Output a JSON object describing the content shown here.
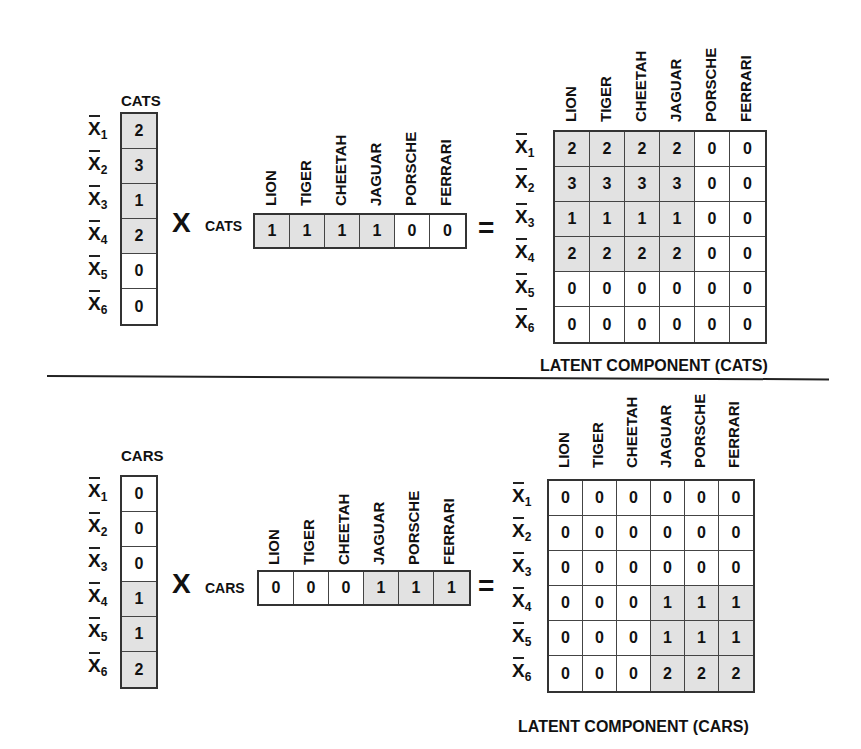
{
  "items": [
    "LION",
    "TIGER",
    "CHEETAH",
    "JAGUAR",
    "PORSCHE",
    "FERRARI"
  ],
  "row_labels": [
    {
      "base": "X",
      "sub": "1"
    },
    {
      "base": "X",
      "sub": "2"
    },
    {
      "base": "X",
      "sub": "3"
    },
    {
      "base": "X",
      "sub": "4"
    },
    {
      "base": "X",
      "sub": "5"
    },
    {
      "base": "X",
      "sub": "6"
    }
  ],
  "operators": {
    "multiply": "X",
    "equals": "="
  },
  "colors": {
    "shaded": "#e2e2e2",
    "line": "#222222",
    "background": "#ffffff"
  },
  "cats": {
    "vector_title": "CATS",
    "row_vector_label": "CATS",
    "user_vector": [
      "2",
      "3",
      "1",
      "2",
      "0",
      "0"
    ],
    "item_vector": [
      "1",
      "1",
      "1",
      "1",
      "0",
      "0"
    ],
    "matrix": [
      [
        "2",
        "2",
        "2",
        "2",
        "0",
        "0"
      ],
      [
        "3",
        "3",
        "3",
        "3",
        "0",
        "0"
      ],
      [
        "1",
        "1",
        "1",
        "1",
        "0",
        "0"
      ],
      [
        "2",
        "2",
        "2",
        "2",
        "0",
        "0"
      ],
      [
        "0",
        "0",
        "0",
        "0",
        "0",
        "0"
      ],
      [
        "0",
        "0",
        "0",
        "0",
        "0",
        "0"
      ]
    ],
    "caption": "LATENT COMPONENT (CATS)"
  },
  "cars": {
    "vector_title": "CARS",
    "row_vector_label": "CARS",
    "user_vector": [
      "0",
      "0",
      "0",
      "1",
      "1",
      "2"
    ],
    "item_vector": [
      "0",
      "0",
      "0",
      "1",
      "1",
      "1"
    ],
    "matrix": [
      [
        "0",
        "0",
        "0",
        "0",
        "0",
        "0"
      ],
      [
        "0",
        "0",
        "0",
        "0",
        "0",
        "0"
      ],
      [
        "0",
        "0",
        "0",
        "0",
        "0",
        "0"
      ],
      [
        "0",
        "0",
        "0",
        "1",
        "1",
        "1"
      ],
      [
        "0",
        "0",
        "0",
        "1",
        "1",
        "1"
      ],
      [
        "0",
        "0",
        "0",
        "2",
        "2",
        "2"
      ]
    ],
    "caption": "LATENT COMPONENT (CARS)"
  }
}
